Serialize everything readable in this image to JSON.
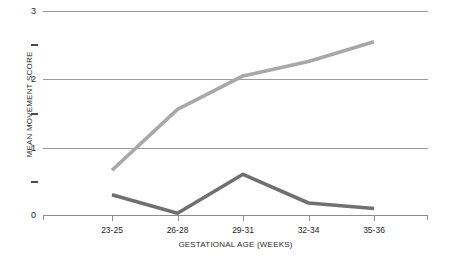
{
  "chart_data": {
    "type": "line",
    "title": "",
    "xlabel": "GESTATIONAL AGE (WEEKS)",
    "ylabel": "MEAN MOVEMENT SCORE",
    "categories": [
      "23-25",
      "26-28",
      "29-31",
      "32-34",
      "35-36"
    ],
    "ylim": [
      0,
      3
    ],
    "yticks": [
      "0",
      "1",
      "2",
      "3"
    ],
    "ytick_values": [
      0,
      1,
      2,
      3
    ],
    "yminor_ticks": [
      0.5,
      1.5,
      2.5
    ],
    "grid": "horizontal",
    "legend": "none",
    "series": [
      {
        "name": "light-gray-series",
        "color": "#a8a8a8",
        "values": [
          0.67,
          1.56,
          2.05,
          2.26,
          2.55
        ]
      },
      {
        "name": "dark-gray-series",
        "color": "#707070",
        "values": [
          0.31,
          0.04,
          0.61,
          0.19,
          0.11
        ]
      }
    ]
  },
  "axes": {
    "y_title": "MEAN MOVEMENT SCORE",
    "x_title": "GESTATIONAL AGE (WEEKS)"
  },
  "colors": {
    "series_light": "#a8a8a8",
    "series_dark": "#707070",
    "gridline": "#9a9a9a",
    "axis": "#8c8c8c",
    "text": "#1d1d1d",
    "background": "#ffffff"
  }
}
